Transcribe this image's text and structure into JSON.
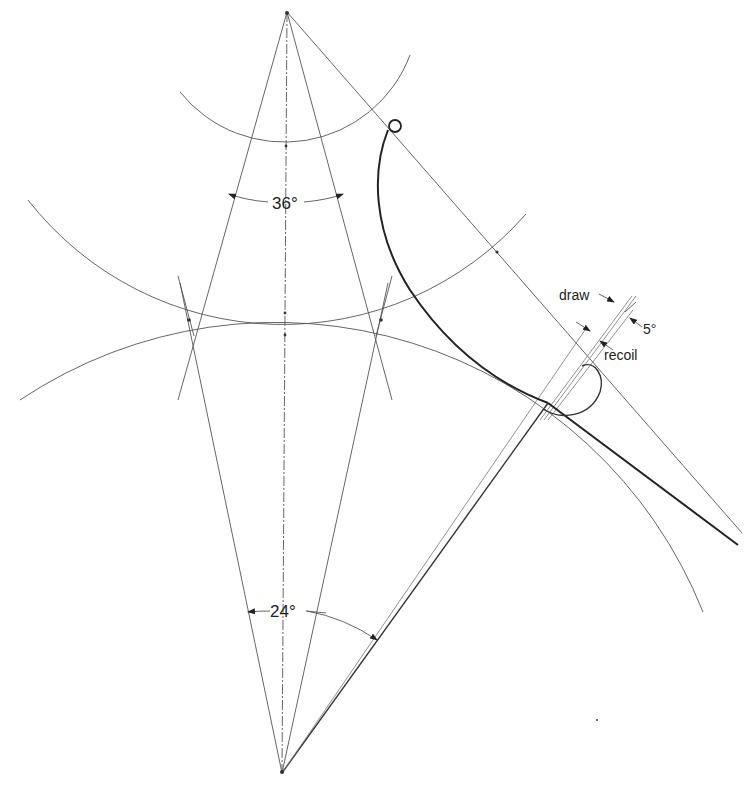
{
  "figure": {
    "labels": {
      "upper_angle": "36°",
      "lower_angle": "24°",
      "draw": "draw",
      "recoil": "recoil",
      "five_degree": "5°"
    },
    "angles_deg": {
      "upper_included_angle": 36,
      "lower_included_angle": 24,
      "draw_recoil_offset": 5
    },
    "line_color": "#333333",
    "background": "#ffffff"
  }
}
